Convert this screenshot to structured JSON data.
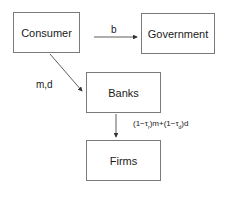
{
  "nodes": {
    "consumer": "Consumer",
    "government": "Government",
    "banks": "Banks",
    "firms": "Firms"
  },
  "edges": {
    "consumer_to_government": "b",
    "consumer_to_banks": "m,d",
    "banks_to_firms": {
      "part1": "(1−τ",
      "sub1": "r",
      "part2": ")m+(1−τ",
      "sub2": "d",
      "part3": ")d"
    }
  },
  "colors": {
    "border": "#7a7a7a",
    "line": "#333333",
    "text": "#1a1a1a"
  }
}
